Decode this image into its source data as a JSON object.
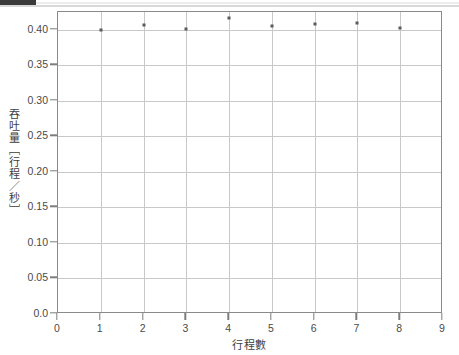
{
  "chart_data": {
    "type": "scatter",
    "title": "",
    "xlabel": "行程數",
    "ylabel": "吞吐量［行程／秒］",
    "xlim": [
      0,
      9
    ],
    "ylim": [
      0.0,
      0.425
    ],
    "grid": true,
    "legend": null,
    "x_ticks": [
      "0",
      "1",
      "2",
      "3",
      "4",
      "5",
      "6",
      "7",
      "8",
      "9"
    ],
    "x_tick_values": [
      0,
      1,
      2,
      3,
      4,
      5,
      6,
      7,
      8,
      9
    ],
    "y_ticks": [
      "0.0",
      "0.05",
      "0.10",
      "0.15",
      "0.20",
      "0.25",
      "0.30",
      "0.35",
      "0.40"
    ],
    "y_tick_values": [
      0.0,
      0.05,
      0.1,
      0.15,
      0.2,
      0.25,
      0.3,
      0.35,
      0.4
    ],
    "marker": "square",
    "marker_color": "#5a5a5a",
    "x": [
      1,
      2,
      3,
      4,
      5,
      6,
      7,
      8
    ],
    "values": [
      0.399,
      0.407,
      0.401,
      0.417,
      0.405,
      0.408,
      0.41,
      0.402
    ],
    "series": [
      {
        "name": "吞吐量",
        "x": [
          1,
          2,
          3,
          4,
          5,
          6,
          7,
          8
        ],
        "values": [
          0.399,
          0.407,
          0.401,
          0.417,
          0.405,
          0.408,
          0.41,
          0.402
        ]
      }
    ]
  },
  "colors": {
    "frame": "#8a8a8a",
    "grid": "#c8c8c8",
    "tick": "#7d7d7d",
    "text": "#4a4a4a",
    "marker": "#5a5a5a",
    "background": "#ffffff"
  }
}
